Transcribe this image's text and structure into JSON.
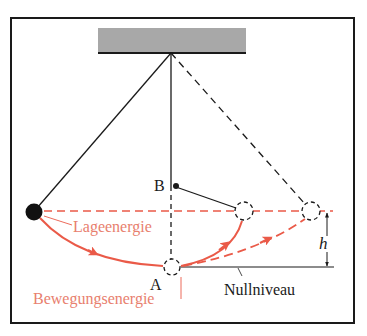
{
  "diagram": {
    "type": "pendulum-energy",
    "labels": {
      "point_a": "A",
      "point_b": "B",
      "potential_energy": "Lageenergie",
      "kinetic_energy": "Bewegungsenergie",
      "zero_level": "Nullniveau",
      "height": "h"
    },
    "colors": {
      "frame": "#1a1a1a",
      "ceiling": "#a8a8a8",
      "line": "#1a1a1a",
      "accent_red": "#ea5a48",
      "accent_red_text": "#e8806e"
    }
  }
}
